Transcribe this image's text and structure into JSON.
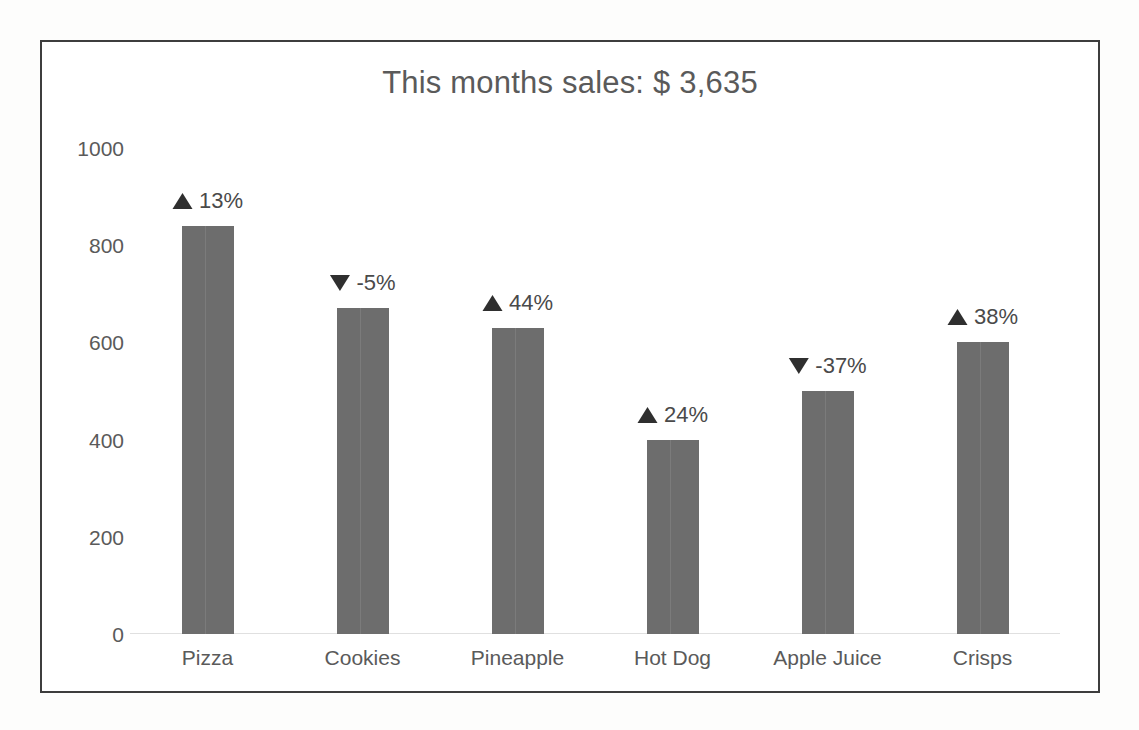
{
  "chart_data": {
    "type": "bar",
    "title": "This months sales: $ 3,635",
    "xlabel": "",
    "ylabel": "",
    "categories": [
      "Pizza",
      "Cookies",
      "Pineapple",
      "Hot Dog",
      "Apple Juice",
      "Crisps"
    ],
    "values": [
      840,
      670,
      630,
      400,
      500,
      600
    ],
    "ylim": [
      0,
      1000
    ],
    "yticks": [
      0,
      200,
      400,
      600,
      800,
      1000
    ],
    "ytick_labels": [
      "0",
      "200",
      "400",
      "600",
      "800",
      "1000"
    ],
    "grid": false,
    "legend": "none",
    "bar_color": "#6d6d6d",
    "annotations": [
      {
        "category": "Pizza",
        "direction": "up",
        "arrow": "up-triangle-icon",
        "label": "13%"
      },
      {
        "category": "Cookies",
        "direction": "down",
        "arrow": "down-triangle-icon",
        "label": "-5%"
      },
      {
        "category": "Pineapple",
        "direction": "up",
        "arrow": "up-triangle-icon",
        "label": "44%"
      },
      {
        "category": "Hot Dog",
        "direction": "up",
        "arrow": "up-triangle-icon",
        "label": "24%"
      },
      {
        "category": "Apple Juice",
        "direction": "down",
        "arrow": "down-triangle-icon",
        "label": "-37%"
      },
      {
        "category": "Crisps",
        "direction": "up",
        "arrow": "up-triangle-icon",
        "label": "38%"
      }
    ]
  },
  "colors": {
    "frame_border": "#3d3d3d",
    "title_text": "#5a5a5a",
    "axis_text": "#5a5a5a",
    "bar_fill": "#6d6d6d",
    "arrow_fill": "#2f2f2f",
    "baseline": "#e0e0e0",
    "plot_background": "#ffffff"
  }
}
